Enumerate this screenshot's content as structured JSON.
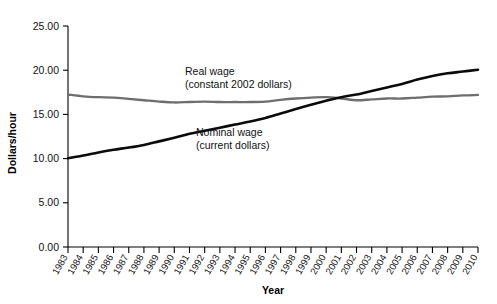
{
  "chart_data": {
    "type": "line",
    "title": "",
    "xlabel": "Year",
    "ylabel": "Dollars/hour",
    "ylim": [
      0,
      25
    ],
    "yticks": [
      0,
      5,
      10,
      15,
      20,
      25
    ],
    "ytick_labels": [
      "0.00",
      "5.00",
      "10.00",
      "15.00",
      "20.00",
      "25.00"
    ],
    "grid": false,
    "legend_position": "inline-annotations",
    "x": [
      1983,
      1984,
      1985,
      1986,
      1987,
      1988,
      1989,
      1990,
      1991,
      1992,
      1993,
      1994,
      1995,
      1996,
      1997,
      1998,
      1999,
      2000,
      2001,
      2002,
      2003,
      2004,
      2005,
      2006,
      2007,
      2008,
      2009,
      2010
    ],
    "xtick_labels": [
      "1983",
      "1984",
      "1985",
      "1986",
      "1987",
      "1988",
      "1989",
      "1990",
      "1991",
      "1992",
      "1993",
      "1994",
      "1995",
      "1996",
      "1997",
      "1998",
      "1999",
      "2000",
      "2001",
      "2002",
      "2003",
      "2004",
      "2005",
      "2006",
      "2007",
      "2008",
      "2009",
      "2010"
    ],
    "series": [
      {
        "name": "Nominal wage",
        "sublabel": "(current dollars)",
        "color": "#0a0a0a",
        "annotation_line1": "Nominal wage",
        "annotation_line2": "(current dollars)",
        "values": [
          10.05,
          10.35,
          10.7,
          11.0,
          11.25,
          11.55,
          11.95,
          12.35,
          12.8,
          13.15,
          13.5,
          13.85,
          14.2,
          14.6,
          15.1,
          15.6,
          16.1,
          16.55,
          16.95,
          17.25,
          17.65,
          18.05,
          18.45,
          18.95,
          19.35,
          19.65,
          19.85,
          20.05
        ]
      },
      {
        "name": "Real wage",
        "sublabel": "(constant 2002 dollars)",
        "color": "#6e6e6e",
        "annotation_line1": "Real wage",
        "annotation_line2": "(constant 2002 dollars)",
        "values": [
          17.25,
          17.05,
          16.95,
          16.9,
          16.75,
          16.6,
          16.45,
          16.35,
          16.4,
          16.45,
          16.4,
          16.4,
          16.4,
          16.45,
          16.65,
          16.8,
          16.9,
          16.95,
          16.8,
          16.6,
          16.7,
          16.8,
          16.8,
          16.9,
          17.0,
          17.05,
          17.15,
          17.2
        ]
      }
    ]
  }
}
